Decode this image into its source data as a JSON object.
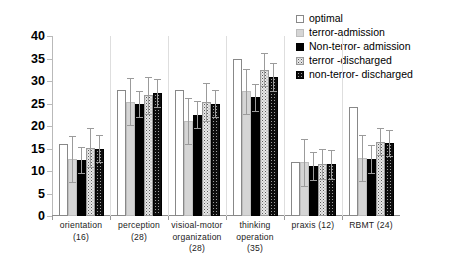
{
  "chart_data": {
    "type": "bar",
    "title": "",
    "xlabel": "",
    "ylabel": "",
    "ylim": [
      0,
      40
    ],
    "yticks": [
      0,
      5,
      10,
      15,
      20,
      25,
      30,
      35,
      40
    ],
    "grid": false,
    "legend_position": "top-right",
    "categories": [
      "orientation (16)",
      "perception (28)",
      "visioal-motor organization (28)",
      "thinking operation (35)",
      "praxis (12)",
      "RBMT (24)"
    ],
    "category_lines": [
      [
        "orientation",
        "(16)"
      ],
      [
        "perception",
        "(28)"
      ],
      [
        "visioal-motor",
        "organization",
        "(28)"
      ],
      [
        "thinking",
        "operation",
        "(35)"
      ],
      [
        "praxis (12)"
      ],
      [
        "RBMT (24)"
      ]
    ],
    "series": [
      {
        "name": "optimal",
        "fill": "white-outline",
        "values": [
          16.0,
          28.0,
          28.0,
          35.0,
          12.0,
          24.2
        ],
        "errors": [
          0,
          0,
          0,
          0,
          0,
          0
        ]
      },
      {
        "name": "terror-admission",
        "fill": "light-gray",
        "values": [
          12.7,
          25.4,
          21.1,
          27.7,
          11.9,
          12.9
        ],
        "errors": [
          5.1,
          5.2,
          5.1,
          5.0,
          5.2,
          5.1
        ]
      },
      {
        "name": "Non-terror- admission",
        "fill": "solid-black",
        "values": [
          12.4,
          24.9,
          22.5,
          26.4,
          11.1,
          12.6
        ],
        "errors": [
          2.9,
          2.9,
          3.0,
          3.0,
          3.1,
          3.1
        ]
      },
      {
        "name": "terror -discharged",
        "fill": "light-speckled",
        "values": [
          15.2,
          26.8,
          25.4,
          32.5,
          11.6,
          16.5
        ],
        "errors": [
          4.4,
          4.2,
          4.2,
          3.7,
          3.3,
          3.0
        ]
      },
      {
        "name": "non-terror- discharged",
        "fill": "dark-dotted",
        "values": [
          15.0,
          27.4,
          25.0,
          30.9,
          11.5,
          16.3
        ],
        "errors": [
          3.1,
          3.1,
          3.1,
          3.2,
          3.2,
          2.9
        ]
      }
    ]
  },
  "legend": {
    "items": [
      {
        "label": "optimal",
        "swatch": "white-outline-swatch"
      },
      {
        "label": "terror-admission",
        "swatch": "light-gray-swatch"
      },
      {
        "label": "Non-terror- admission",
        "swatch": "solid-black-swatch"
      },
      {
        "label": "terror -discharged",
        "swatch": "light-speckled-swatch"
      },
      {
        "label": "non-terror- discharged",
        "swatch": "dark-dotted-swatch"
      }
    ]
  },
  "colors": {
    "optimal": "#ffffff",
    "terror_admission": "#d5d5d5",
    "non_terror_admission": "#000000",
    "terror_discharged": "#e8e8e8",
    "non_terror_discharged": "#0d0d0d",
    "axis": "#8c8c8c",
    "error_bar": "#9b9b9b",
    "text": "#000000"
  }
}
